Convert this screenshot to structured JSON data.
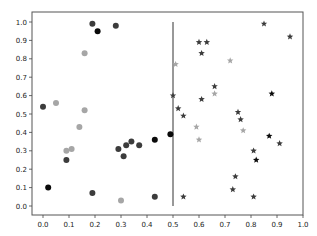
{
  "chart_data": {
    "type": "scatter",
    "title": "",
    "xlabel": "",
    "ylabel": "",
    "xlim": [
      -0.04,
      1.0
    ],
    "ylim": [
      -0.05,
      1.05
    ],
    "grid": false,
    "legend": null,
    "x_ticks": [
      "0.0",
      "0.1",
      "0.2",
      "0.3",
      "0.4",
      "0.5",
      "0.6",
      "0.7",
      "0.8",
      "0.9",
      "1.0"
    ],
    "y_ticks": [
      "0.0",
      "0.1",
      "0.2",
      "0.3",
      "0.4",
      "0.5",
      "0.6",
      "0.7",
      "0.8",
      "0.9",
      "1.0"
    ],
    "annotations": [
      {
        "type": "vertical_line",
        "x": 0.5,
        "y_from": 0.0,
        "y_to": 1.0,
        "color": "#333333"
      }
    ],
    "series": [
      {
        "name": "circles",
        "marker": "circle",
        "points": [
          {
            "x": 0.0,
            "y": 0.54,
            "shade": "dark"
          },
          {
            "x": 0.02,
            "y": 0.1,
            "shade": "black"
          },
          {
            "x": 0.05,
            "y": 0.56,
            "shade": "light"
          },
          {
            "x": 0.09,
            "y": 0.25,
            "shade": "dark"
          },
          {
            "x": 0.09,
            "y": 0.3,
            "shade": "light"
          },
          {
            "x": 0.11,
            "y": 0.31,
            "shade": "light"
          },
          {
            "x": 0.14,
            "y": 0.43,
            "shade": "light"
          },
          {
            "x": 0.16,
            "y": 0.83,
            "shade": "light"
          },
          {
            "x": 0.16,
            "y": 0.52,
            "shade": "light"
          },
          {
            "x": 0.19,
            "y": 0.99,
            "shade": "dark"
          },
          {
            "x": 0.21,
            "y": 0.95,
            "shade": "black"
          },
          {
            "x": 0.19,
            "y": 0.07,
            "shade": "dark"
          },
          {
            "x": 0.28,
            "y": 0.98,
            "shade": "dark"
          },
          {
            "x": 0.29,
            "y": 0.31,
            "shade": "dark"
          },
          {
            "x": 0.3,
            "y": 0.03,
            "shade": "light"
          },
          {
            "x": 0.31,
            "y": 0.27,
            "shade": "dark"
          },
          {
            "x": 0.32,
            "y": 0.33,
            "shade": "dark"
          },
          {
            "x": 0.34,
            "y": 0.35,
            "shade": "dark"
          },
          {
            "x": 0.37,
            "y": 0.33,
            "shade": "dark"
          },
          {
            "x": 0.43,
            "y": 0.36,
            "shade": "black"
          },
          {
            "x": 0.43,
            "y": 0.05,
            "shade": "dark"
          },
          {
            "x": 0.49,
            "y": 0.39,
            "shade": "black"
          }
        ]
      },
      {
        "name": "stars",
        "marker": "star",
        "points": [
          {
            "x": 0.51,
            "y": 0.77,
            "shade": "light"
          },
          {
            "x": 0.5,
            "y": 0.6,
            "shade": "dark"
          },
          {
            "x": 0.52,
            "y": 0.53,
            "shade": "dark"
          },
          {
            "x": 0.54,
            "y": 0.49,
            "shade": "dark"
          },
          {
            "x": 0.54,
            "y": 0.05,
            "shade": "dark"
          },
          {
            "x": 0.59,
            "y": 0.43,
            "shade": "light"
          },
          {
            "x": 0.6,
            "y": 0.36,
            "shade": "light"
          },
          {
            "x": 0.6,
            "y": 0.89,
            "shade": "dark"
          },
          {
            "x": 0.63,
            "y": 0.89,
            "shade": "dark"
          },
          {
            "x": 0.61,
            "y": 0.83,
            "shade": "dark"
          },
          {
            "x": 0.61,
            "y": 0.58,
            "shade": "dark"
          },
          {
            "x": 0.66,
            "y": 0.65,
            "shade": "dark"
          },
          {
            "x": 0.66,
            "y": 0.61,
            "shade": "light"
          },
          {
            "x": 0.72,
            "y": 0.79,
            "shade": "light"
          },
          {
            "x": 0.73,
            "y": 0.09,
            "shade": "dark"
          },
          {
            "x": 0.74,
            "y": 0.16,
            "shade": "dark"
          },
          {
            "x": 0.75,
            "y": 0.51,
            "shade": "dark"
          },
          {
            "x": 0.77,
            "y": 0.41,
            "shade": "light"
          },
          {
            "x": 0.76,
            "y": 0.47,
            "shade": "dark"
          },
          {
            "x": 0.81,
            "y": 0.05,
            "shade": "dark"
          },
          {
            "x": 0.81,
            "y": 0.3,
            "shade": "dark"
          },
          {
            "x": 0.82,
            "y": 0.25,
            "shade": "black"
          },
          {
            "x": 0.85,
            "y": 0.99,
            "shade": "dark"
          },
          {
            "x": 0.87,
            "y": 0.38,
            "shade": "black"
          },
          {
            "x": 0.88,
            "y": 0.61,
            "shade": "black"
          },
          {
            "x": 0.91,
            "y": 0.34,
            "shade": "dark"
          },
          {
            "x": 0.95,
            "y": 0.92,
            "shade": "dark"
          }
        ]
      }
    ],
    "shade_colors": {
      "black": "#0a0a0a",
      "dark": "#3c3c3c",
      "light": "#a6a6a6"
    }
  }
}
